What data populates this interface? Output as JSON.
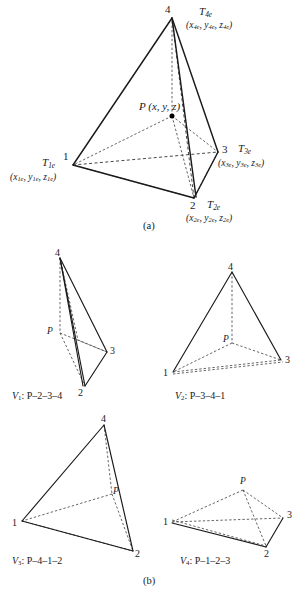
{
  "figure": {
    "panels": [
      {
        "id": "a",
        "caption": "(a)"
      },
      {
        "id": "b",
        "caption": "(b)"
      }
    ],
    "main": {
      "vertices": [
        {
          "name": "vertex-1",
          "number": "1",
          "tag_base": "T",
          "tag_sub": "1e",
          "coords": "(x1e, y1e, z1e)",
          "coord_parts": [
            {
              "v": "x",
              "s": "1e"
            },
            {
              "v": "y",
              "s": "1e"
            },
            {
              "v": "z",
              "s": "1e"
            }
          ]
        },
        {
          "name": "vertex-2",
          "number": "2",
          "tag_base": "T",
          "tag_sub": "2e",
          "coords": "(x2e, y2e, z2e)",
          "coord_parts": [
            {
              "v": "x",
              "s": "2e"
            },
            {
              "v": "y",
              "s": "2e"
            },
            {
              "v": "z",
              "s": "2e"
            }
          ]
        },
        {
          "name": "vertex-3",
          "number": "3",
          "tag_base": "T",
          "tag_sub": "3e",
          "coords": "(x3e, y3e, z3e)",
          "coord_parts": [
            {
              "v": "x",
              "s": "3e"
            },
            {
              "v": "y",
              "s": "3e"
            },
            {
              "v": "z",
              "s": "3e"
            }
          ]
        },
        {
          "name": "vertex-4",
          "number": "4",
          "tag_base": "T",
          "tag_sub": "4e",
          "coords": "(x4e, y4e, z4e)",
          "coord_parts": [
            {
              "v": "x",
              "s": "4e"
            },
            {
              "v": "y",
              "s": "4e"
            },
            {
              "v": "z",
              "s": "4e"
            }
          ]
        }
      ],
      "interior_point": {
        "label": "P",
        "coords": "(x, y, z)"
      }
    },
    "subfigures": [
      {
        "id": "V1",
        "caption_symbol": "V",
        "caption_sub": "1",
        "caption_body": ": P–2–3–4",
        "caption_full": "V1 : P–2–3–4",
        "vertex_labels": [
          "4",
          "3",
          "2"
        ],
        "point_label": "P"
      },
      {
        "id": "V2",
        "caption_symbol": "V",
        "caption_sub": "2",
        "caption_body": ": P–3–4–1",
        "caption_full": "V2 : P–3–4–1",
        "vertex_labels": [
          "4",
          "3",
          "1"
        ],
        "point_label": "P"
      },
      {
        "id": "V3",
        "caption_symbol": "V",
        "caption_sub": "3",
        "caption_body": ": P–4–1–2",
        "caption_full": "V3 : P–4–1–2",
        "vertex_labels": [
          "4",
          "1",
          "2"
        ],
        "point_label": "P"
      },
      {
        "id": "V4",
        "caption_symbol": "V",
        "caption_sub": "4",
        "caption_body": ": P–1–2–3",
        "caption_full": "V4 : P–1–2–3",
        "vertex_labels": [
          "1",
          "2",
          "3"
        ],
        "point_label": "P"
      }
    ],
    "colors": {
      "ink": "#1a1a1a",
      "background": "#ffffff",
      "hidden_edge": "#333333"
    }
  }
}
